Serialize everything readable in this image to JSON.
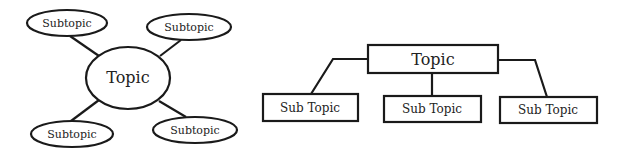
{
  "colors": {
    "background": "#ffffff",
    "stroke": "#1a1a1a",
    "text": "#222222"
  },
  "web_diagram": {
    "center": {
      "label": "Topic",
      "cx": 128,
      "cy": 78,
      "rx": 42,
      "ry": 31
    },
    "nodes": [
      {
        "label": "Subtopic",
        "cx": 67,
        "cy": 23,
        "rx": 40,
        "ry": 13
      },
      {
        "label": "Subtopic",
        "cx": 189,
        "cy": 27,
        "rx": 42,
        "ry": 13
      },
      {
        "label": "Subtopic",
        "cx": 72,
        "cy": 134,
        "rx": 41,
        "ry": 13
      },
      {
        "label": "Subtopic",
        "cx": 195,
        "cy": 130,
        "rx": 42,
        "ry": 13
      }
    ]
  },
  "hierarchy_diagram": {
    "root": {
      "label": "Topic",
      "x": 368,
      "y": 45,
      "w": 130,
      "h": 28
    },
    "children": [
      {
        "label": "Sub Topic",
        "x": 263,
        "y": 94,
        "w": 95,
        "h": 27
      },
      {
        "label": "Sub Topic",
        "x": 384,
        "y": 96,
        "w": 97,
        "h": 26
      },
      {
        "label": "Sub Topic",
        "x": 500,
        "y": 97,
        "w": 97,
        "h": 26
      }
    ]
  }
}
